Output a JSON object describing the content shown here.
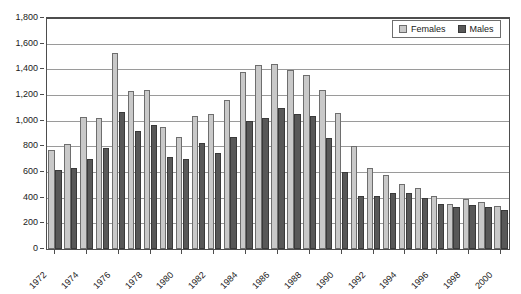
{
  "chart_data": {
    "type": "bar",
    "title": "",
    "xlabel": "",
    "ylabel": "",
    "ylim": [
      0,
      1800
    ],
    "y_ticks": [
      0,
      200,
      400,
      600,
      800,
      1000,
      1200,
      1400,
      1600,
      1800
    ],
    "y_tick_labels": [
      "0",
      "200",
      "400",
      "600",
      "800",
      "1,000",
      "1,200",
      "1,400",
      "1,600",
      "1,800"
    ],
    "grid": true,
    "legend_position": "top-right",
    "x_tick_labels": [
      "1972",
      "1974",
      "1976",
      "1978",
      "1980",
      "1982",
      "1984",
      "1986",
      "1988",
      "1990",
      "1992",
      "1994",
      "1996",
      "1998",
      "2000"
    ],
    "categories": [
      "1972",
      "1973",
      "1974",
      "1975",
      "1976",
      "1977",
      "1978",
      "1979",
      "1980",
      "1981",
      "1982",
      "1983",
      "1984",
      "1985",
      "1986",
      "1987",
      "1988",
      "1989",
      "1990",
      "1991",
      "1992",
      "1993",
      "1994",
      "1995",
      "1996",
      "1997",
      "1998",
      "1999",
      "2000"
    ],
    "series": [
      {
        "name": "Females",
        "color": "#c9c9c9",
        "values": [
          770,
          815,
          1030,
          1020,
          1530,
          1230,
          1240,
          950,
          870,
          1035,
          1055,
          1165,
          1380,
          1430,
          1440,
          1395,
          1355,
          1240,
          1060,
          800,
          630,
          575,
          505,
          475,
          410,
          350,
          390,
          370,
          335
        ]
      },
      {
        "name": "Males",
        "color": "#585858",
        "values": [
          615,
          630,
          700,
          785,
          1065,
          920,
          970,
          720,
          700,
          825,
          745,
          870,
          1000,
          1020,
          1100,
          1050,
          1040,
          865,
          600,
          410,
          415,
          440,
          440,
          395,
          350,
          330,
          345,
          330,
          305
        ]
      }
    ]
  },
  "legend": {
    "entries": [
      {
        "label": "Females",
        "swatch": "female-swatch"
      },
      {
        "label": "Males",
        "swatch": "male-swatch"
      }
    ]
  }
}
